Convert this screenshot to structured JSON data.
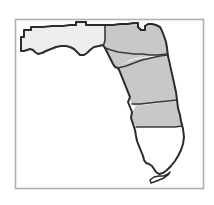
{
  "figure": {
    "kind": "choropleth-map",
    "width": 214,
    "height": 205,
    "background_color": "#ffffff"
  },
  "frame": {
    "name": "map-border-frame",
    "x": 15.5,
    "y": 19.5,
    "width": 188,
    "height": 169,
    "stroke_color": "#b0b0b0",
    "stroke_width": 1.6,
    "fill_color": "#ffffff"
  },
  "palette": {
    "shade_light": "#ededed",
    "shade_medium": "#c8c8c8",
    "shade_none": "#ffffff",
    "outline_dark": "#2b2b2b",
    "outline_internal": "#3a3a3a",
    "frame_gray": "#b0b0b0"
  },
  "regions": [
    {
      "id": "panhandle",
      "label": "Panhandle",
      "shade": "light",
      "fill": "#ededed",
      "path": "M 21 48 L 21 37 L 24 37 L 24 30 L 31 30 L 31 27 L 43 27 L 52 26 L 63 26 L 70 25 L 76 25 L 76 22 L 86 22 L 86 25 L 96 25 L 100 25 L 105 25 L 105 31 L 105 40 L 103 44 L 99 46 L 94 47 L 90 50 L 87 53 L 84 55 L 80 55 L 77 52 L 74 49 L 70 47 L 66 46 L 61 46 L 56 47 L 51 49 L 46 51 L 42 53 L 38 54 L 35 52 L 33 50 L 30 49 L 27 50 L 24 51 L 21 51 Z"
    },
    {
      "id": "north-central",
      "label": "North Central",
      "shade": "medium",
      "fill": "#c8c8c8",
      "path": "M 105 25 L 113 25 L 120 24 L 128 24 L 133 23 L 138 23 L 138 27 L 141 30 L 145 30 L 145 26 L 148 24 L 152 24 L 156 25 L 160 27 L 162 31 L 164 36 L 166 42 L 167 48 L 167 54 L 160 55 L 152 56 L 144 57 L 136 58 L 130 60 L 125 63 L 121 66 L 118 68 L 115 67 L 113 64 L 111 60 L 109 56 L 107 52 L 105 48 L 104 44 L 105 38 Z"
    },
    {
      "id": "peninsula-north",
      "label": "North Peninsula",
      "shade": "medium",
      "fill": "#c8c8c8",
      "path": "M 118 68 L 122 65 L 128 62 L 135 59 L 143 58 L 152 57 L 160 56 L 167 55 L 168 62 L 170 70 L 172 78 L 174 86 L 176 94 L 177 100 L 170 101 L 162 102 L 154 103 L 147 104 L 141 105 L 136 106 L 132 104 L 130 100 L 128 95 L 126 90 L 124 85 L 122 80 L 120 75 Z"
    },
    {
      "id": "peninsula-central",
      "label": "Central Peninsula",
      "shade": "medium",
      "fill": "#c8c8c8",
      "path": "M 136 106 L 143 105 L 151 104 L 159 103 L 168 102 L 177 101 L 178 107 L 180 114 L 181 120 L 182 126 L 174 127 L 165 127 L 156 127 L 148 127 L 140 127 L 136 126 L 133 123 L 131 118 L 132 113 L 134 109 Z"
    },
    {
      "id": "south-florida",
      "label": "South Florida",
      "shade": "none",
      "fill": "#ffffff",
      "path": "M 136 127 L 145 127 L 155 127 L 165 127 L 175 127 L 182 126 L 183 132 L 184 138 L 183 144 L 181 150 L 178 156 L 175 161 L 171 166 L 167 170 L 163 173 L 159 174 L 156 172 L 154 169 L 152 166 L 149 164 L 146 163 L 144 160 L 143 156 L 141 151 L 139 146 L 137 141 L 136 136 Z"
    }
  ],
  "outlines": [
    {
      "id": "state-outline",
      "name": "florida-state-outline",
      "path": "M 21 51 L 21 37 L 24 37 L 24 30 L 31 30 L 31 27 L 43 27 L 52 26 L 63 26 L 70 25 L 76 25 L 76 22 L 86 22 L 86 25 L 96 25 L 105 25 L 113 25 L 120 24 L 128 24 L 133 23 L 138 23 L 138 27 L 141 30 L 145 30 L 145 26 L 148 24 L 152 24 L 156 25 L 160 27 L 162 31 L 164 36 L 166 42 L 167 48 L 168 56 L 170 65 L 172 74 L 174 83 L 176 92 L 177 100 L 178 108 L 180 115 L 181 121 L 183 129 L 184 137 L 183 144 L 181 150 L 178 156 L 175 161 L 171 166 L 167 170 L 163 173 L 159 174 L 156 172 L 154 169 L 152 166 L 149 164 L 146 163 L 144 160 L 143 156 L 141 151 L 139 146 L 137 141 L 136 136 L 135 130 L 133 124 L 131 118 L 132 112 L 130 107 L 128 102 L 130 97 L 128 92 L 126 87 L 124 82 L 122 77 L 120 72 L 118 68 L 115 67 L 113 64 L 111 60 L 109 56 L 107 52 L 105 48 L 103 45 L 99 46 L 94 47 L 90 50 L 87 53 L 84 55 L 80 55 L 77 52 L 74 49 L 70 47 L 66 46 L 61 46 L 56 47 L 51 49 L 46 51 L 42 53 L 38 54 L 35 52 L 33 50 L 30 49 L 27 50 L 24 51 Z"
    }
  ],
  "internal_borders": [
    {
      "id": "panhandle-divide",
      "name": "panhandle-east-boundary",
      "path": "M 105 25 L 105 31 L 105 40 L 104 44 L 103 45"
    },
    {
      "id": "northeast-notch",
      "name": "st-marys-river-notch",
      "path": "M 138 23 L 138 27 L 141 30 L 145 30 L 145 26"
    },
    {
      "id": "north-central-south",
      "name": "north-central-south-boundary",
      "path": "M 105 48 L 111 50 L 118 52 L 126 53 L 134 54 L 142 54 L 150 55 L 158 55 L 167 54"
    },
    {
      "id": "peninsula-north-south",
      "name": "north-peninsula-south-boundary",
      "path": "M 118 68 L 126 66 L 134 63 L 142 60 L 151 58 L 160 56 L 167 55"
    },
    {
      "id": "peninsula-central-north",
      "name": "central-peninsula-north-boundary",
      "path": "M 132 104 L 140 104 L 149 103 L 158 102 L 168 101 L 177 100"
    },
    {
      "id": "shading-terminus",
      "name": "south-florida-north-boundary",
      "path": "M 136 127 L 145 127 L 155 127 L 165 127 L 175 127 L 182 126"
    },
    {
      "id": "panhandle-north-step",
      "name": "panhandle-georgia-border-step",
      "path": "M 76 25 L 76 22 L 86 22 L 86 25"
    }
  ],
  "islands": [
    {
      "id": "florida-keys",
      "label": "Florida Keys",
      "fill": "#ffffff",
      "path": "M 150 180 L 154 177 L 159 176 L 164 176 L 168 174 L 170 172 L 168 175 L 164 178 L 159 180 L 154 182 L 151 183 Z"
    }
  ]
}
